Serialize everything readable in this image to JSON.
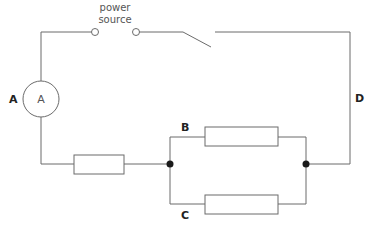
{
  "diagram": {
    "type": "circuit",
    "power_source": {
      "line1": "power",
      "line2": "source"
    },
    "ammeter": {
      "symbol": "A"
    },
    "labels": {
      "A": "A",
      "B": "B",
      "C": "C",
      "D": "D"
    },
    "components": [
      {
        "name": "power-source-terminals",
        "kind": "terminal-pair"
      },
      {
        "name": "switch",
        "kind": "switch",
        "state": "open"
      },
      {
        "name": "ammeter",
        "kind": "ammeter",
        "label": "A"
      },
      {
        "name": "series-resistor",
        "kind": "resistor"
      },
      {
        "name": "parallel-resistor-top",
        "kind": "resistor",
        "branch": "B"
      },
      {
        "name": "parallel-resistor-bottom",
        "kind": "resistor",
        "branch": "C"
      }
    ],
    "colors": {
      "wire": "#6b6b6b",
      "junction": "#1a1a1a",
      "text": "#555555"
    }
  }
}
